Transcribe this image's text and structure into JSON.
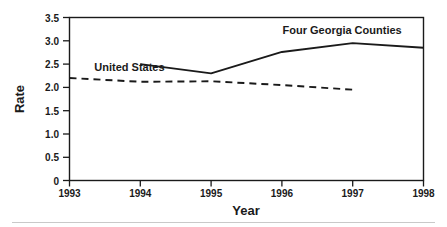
{
  "chart_data": {
    "type": "line",
    "title": "",
    "xlabel": "Year",
    "ylabel": "Rate",
    "x": [
      1993,
      1994,
      1995,
      1996,
      1997,
      1998
    ],
    "xlim": [
      1993,
      1998
    ],
    "ylim": [
      0,
      3.5
    ],
    "xticklabels": [
      "1993",
      "1994",
      "1995",
      "1996",
      "1997",
      "1998"
    ],
    "yticklabels": [
      "0",
      "0.5",
      "1.0",
      "1.5",
      "2.0",
      "2.5",
      "3.0",
      "3.5"
    ],
    "ytickvalues": [
      0,
      0.5,
      1.0,
      1.5,
      2.0,
      2.5,
      3.0,
      3.5
    ],
    "grid": false,
    "legend": "inline-annotations",
    "series": [
      {
        "name": "Four Georgia Counties",
        "style": "solid",
        "color": "#1a1a1a",
        "x": [
          1994,
          1995,
          1996,
          1997,
          1998
        ],
        "values": [
          2.5,
          2.3,
          2.76,
          2.95,
          2.85
        ],
        "label_x": 1996.85,
        "label_y": 3.15
      },
      {
        "name": "United States",
        "style": "dashed",
        "color": "#1a1a1a",
        "x": [
          1993,
          1994,
          1995,
          1996,
          1997
        ],
        "values": [
          2.2,
          2.12,
          2.13,
          2.05,
          1.95
        ],
        "label_x": 1993.35,
        "label_y": 2.36
      }
    ]
  },
  "axes": {
    "x_title": "Year",
    "y_title": "Rate"
  },
  "footer": {
    "rule": "divider"
  }
}
